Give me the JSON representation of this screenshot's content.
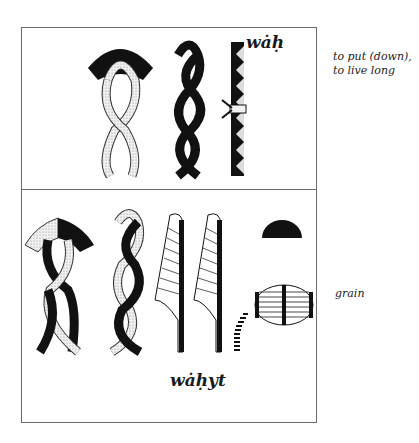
{
  "entries": [
    {
      "transliteration": "wȧḥ",
      "gloss_lines": [
        "to put (down),",
        "to live long"
      ],
      "glyphs": [
        "basket-with-twisted-rope",
        "twisted-rope-dark",
        "toothed-staff-with-tie"
      ]
    },
    {
      "transliteration": "wȧḥyt",
      "gloss_lines": [
        "grain"
      ],
      "glyphs": [
        "basket-with-twisted-rope-mixed",
        "twisted-rope-mixed",
        "reed-leaf",
        "reed-leaf",
        "dotted-curve",
        "half-circle-bread",
        "grain-heap-oval"
      ]
    }
  ],
  "colors": {
    "ink": "#111111",
    "stipple": "#d9d9d9",
    "border": "#6a6a6a"
  }
}
